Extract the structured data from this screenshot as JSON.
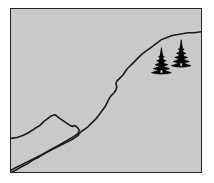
{
  "artwork": {
    "title": "Mountain Landscape Line Drawing",
    "caption": "Framed monochrome landscape sketch with ridgeline and two conifers",
    "medium": "line-art",
    "canvas": {
      "width": 214,
      "height": 183
    }
  },
  "colors": {
    "page_background": "#ffffff",
    "frame_border": "#262626",
    "field_fill": "#c9c9c9",
    "ink": "#1a1a1a",
    "tree_silhouette": "#000000"
  },
  "frame": {
    "name": "picture-frame",
    "x": 10,
    "y": 8,
    "width": 192,
    "height": 165,
    "border_width": 1.5
  },
  "scene": {
    "viewbox": "0 0 192 165",
    "elements": [
      {
        "name": "main-ridgeline",
        "label": "Main ridge rising from lower left to upper right",
        "stroke_width": 1.6,
        "path": "M 0 163 L 6 160 L 14 156 L 22 152 L 30 148 L 38 144 L 46 140 L 54 136 L 62 132 L 68 128 L 69 126 L 71 124 L 74 122 L 78 119 L 82 115 L 86 111 L 89 107 L 92 103 L 95 99 L 97 95 L 99 91 L 101 88 L 104 85 L 106 82 L 107 79 L 106 76 L 107 73 L 110 70 L 113 67 L 115 64 L 117 61 L 120 58 L 123 55 L 126 52 L 129 49 L 132 46 L 136 43 L 140 40 L 144 37 L 148 34 L 152 31 L 157 29 L 162 27 L 167 26 L 173 25 L 179 24 L 185 24 L 192 23"
      },
      {
        "name": "foreground-peak-ridge",
        "label": "Smaller foreground peak on the left",
        "stroke_width": 1.6,
        "path": "M 0 131 L 6 130 L 12 128 L 18 125 L 24 121 L 29 118 L 33 114 L 37 111 L 41 108 L 44 107 L 46 108 L 48 110 L 51 112 L 54 114 L 57 116 L 60 118 L 62 119 L 64 118 L 66 119 L 68 121 L 69 123 L 68 125"
      },
      {
        "name": "valley-floor-line",
        "label": "Valley line descending to the bottom left corner",
        "stroke_width": 1.6,
        "path": "M 68 126 L 62 130 L 55 134 L 48 138 L 41 142 L 34 146 L 28 150 L 22 153 L 16 157 L 10 160 L 5 163 L 1 165"
      }
    ],
    "trees": [
      {
        "name": "conifer-tree-left",
        "label": "Conifer silhouette (front, lower-left of pair)",
        "cx": 152,
        "base_y": 65,
        "height": 27,
        "half_width": 10
      },
      {
        "name": "conifer-tree-right",
        "label": "Conifer silhouette (back, upper-right of pair)",
        "cx": 172,
        "base_y": 58,
        "height": 28,
        "half_width": 10
      }
    ]
  }
}
